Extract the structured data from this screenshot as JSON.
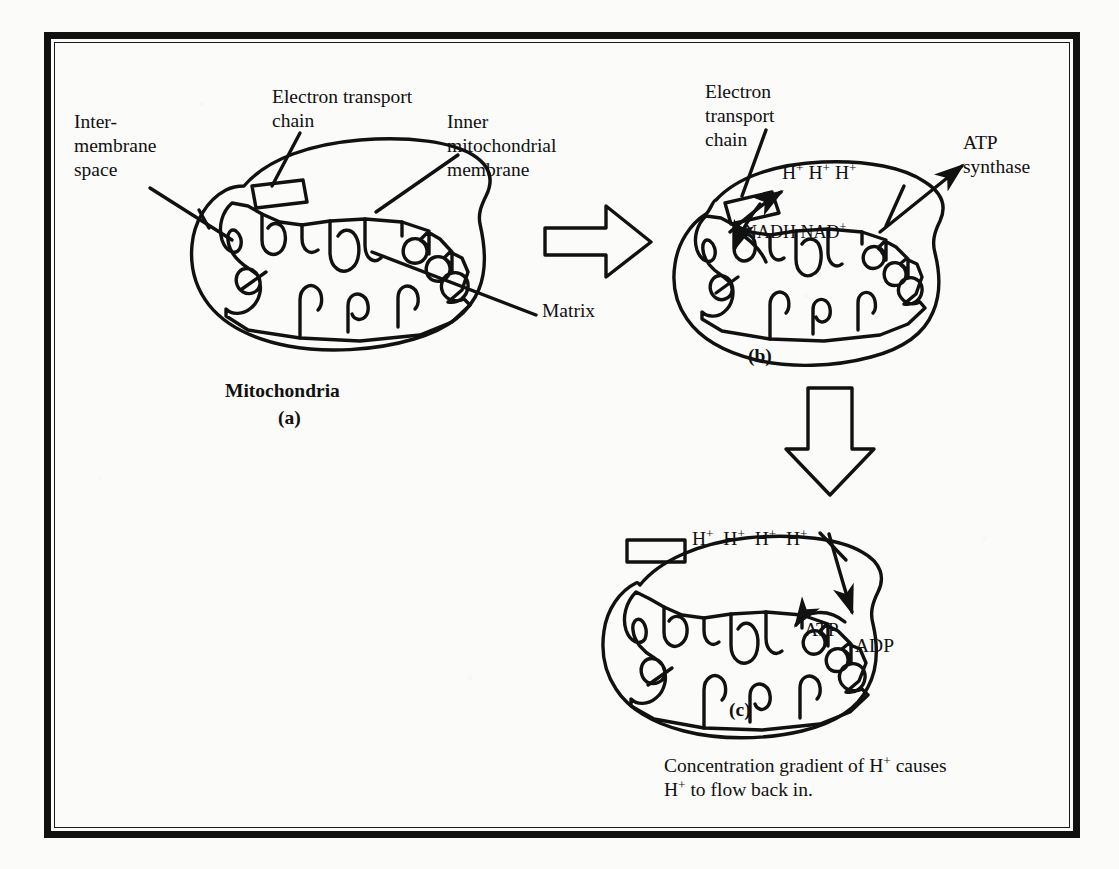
{
  "figure": {
    "background_color": "#fbfbfa",
    "ink_color": "#111111"
  },
  "panel_a": {
    "caption_title": "Mitochondria",
    "caption_letter": "(a)",
    "labels": {
      "intermembrane_space": "Inter-\nmembrane\nspace",
      "electron_transport_chain": "Electron transport\nchain",
      "inner_mitochondrial_membrane": "Inner\nmitochondrial\nmembrane",
      "matrix": "Matrix"
    }
  },
  "panel_b": {
    "caption_letter": "(b)",
    "labels": {
      "electron_transport_chain": "Electron\ntransport\nchain",
      "atp_synthase": "ATP\nsynthase",
      "nadh": "NADH",
      "nad_plus": "NAD",
      "nad_plus_charge": "+",
      "proton": "H",
      "proton_charge": "+",
      "proton_count": 3
    }
  },
  "panel_c": {
    "caption_letter": "(c)",
    "labels": {
      "atp": "ATP",
      "adp": "ADP",
      "proton": "H",
      "proton_charge": "+",
      "proton_count": 4
    },
    "caption_line1_pre": "Concentration gradient of H",
    "caption_line1_sup": "+",
    "caption_line1_post": " causes",
    "caption_line2_pre": "H",
    "caption_line2_sup": "+",
    "caption_line2_post": " to flow back in."
  },
  "arrows": {
    "a_to_b": "block-arrow-right",
    "b_to_c": "block-arrow-down"
  }
}
